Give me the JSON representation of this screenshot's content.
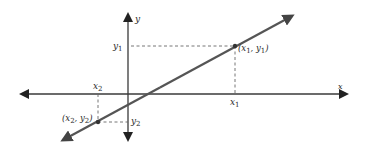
{
  "diagram": {
    "type": "cartesian-line-through-two-points",
    "colors": {
      "axis": "#3a3a3a",
      "line": "#555555",
      "dash": "#666666",
      "text": "#2a2a2a"
    },
    "axes": {
      "x_label": "x",
      "y_label": "y"
    },
    "points": [
      {
        "id": "p1",
        "label": "(x1, y1)",
        "x_name": "x",
        "x_sub": "1",
        "y_name": "y",
        "y_sub": "1"
      },
      {
        "id": "p2",
        "label": "(x2, y2)",
        "x_name": "x",
        "x_sub": "2",
        "y_name": "y",
        "y_sub": "2"
      }
    ],
    "tick_labels": {
      "x1": {
        "name": "x",
        "sub": "1"
      },
      "y1": {
        "name": "y",
        "sub": "1"
      },
      "x2": {
        "name": "x",
        "sub": "2"
      },
      "y2": {
        "name": "y",
        "sub": "2"
      }
    },
    "point_labels": {
      "p1_open": "(",
      "p1_x": "x",
      "p1_xsub": "1",
      "p1_sep": ", ",
      "p1_y": "y",
      "p1_ysub": "1",
      "p1_close": ")",
      "p2_open": "(",
      "p2_x": "x",
      "p2_xsub": "2",
      "p2_sep": ", ",
      "p2_y": "y",
      "p2_ysub": "2",
      "p2_close": ")"
    }
  }
}
